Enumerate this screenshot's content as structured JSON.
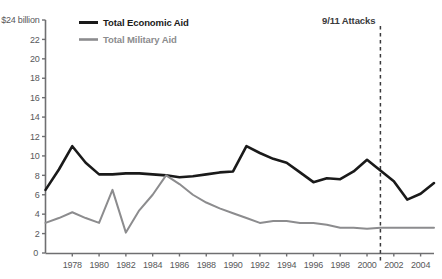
{
  "chart_data": {
    "type": "line",
    "title": "",
    "xlabel": "",
    "ylabel": "",
    "y_axis_top_label": "$24 billion",
    "xlim": [
      1976,
      2005
    ],
    "ylim": [
      0,
      24
    ],
    "grid": false,
    "legend_position": "top-left-inside",
    "y_ticks": [
      0,
      2,
      4,
      6,
      8,
      10,
      12,
      14,
      16,
      18,
      20,
      22,
      24
    ],
    "y_tick_labels": [
      "0",
      "2",
      "4",
      "6",
      "8",
      "10",
      "12",
      "14",
      "16",
      "18",
      "20",
      "22",
      "$24 billion"
    ],
    "x_ticks": [
      1978,
      1980,
      1982,
      1984,
      1986,
      1988,
      1990,
      1992,
      1994,
      1996,
      1998,
      2000,
      2002,
      2004
    ],
    "x_tick_labels": [
      "1978",
      "1980",
      "1982",
      "1984",
      "1986",
      "1988",
      "1990",
      "1992",
      "1994",
      "1996",
      "1998",
      "2000",
      "2002",
      "2004"
    ],
    "x_origin_label": "0",
    "x": [
      1976,
      1977,
      1978,
      1979,
      1980,
      1981,
      1982,
      1983,
      1984,
      1985,
      1986,
      1987,
      1988,
      1989,
      1990,
      1991,
      1992,
      1993,
      1994,
      1995,
      1996,
      1997,
      1998,
      1999,
      2000,
      2001,
      2002,
      2003,
      2004,
      2005
    ],
    "series": [
      {
        "name": "Total Economic Aid",
        "color": "#1a1a1a",
        "width": 2.6,
        "values": [
          6.5,
          8.6,
          11.0,
          9.3,
          8.1,
          8.1,
          8.2,
          8.2,
          8.1,
          8.0,
          7.8,
          7.9,
          8.1,
          8.3,
          8.4,
          11.0,
          10.3,
          9.7,
          9.3,
          8.3,
          7.3,
          7.7,
          7.6,
          8.4,
          9.6,
          8.5,
          7.4,
          5.5,
          6.1,
          7.2
        ]
      },
      {
        "name": "Total Military Aid",
        "color": "#8c8c8e",
        "width": 2.0,
        "values": [
          3.1,
          3.6,
          4.2,
          3.6,
          3.1,
          6.5,
          2.1,
          4.4,
          6.0,
          8.0,
          7.1,
          6.0,
          5.2,
          4.6,
          4.1,
          3.6,
          3.1,
          3.3,
          3.3,
          3.1,
          3.1,
          2.9,
          2.6,
          2.6,
          2.5,
          2.6,
          2.6,
          2.6,
          2.6,
          2.6
        ]
      }
    ],
    "annotations": [
      {
        "label": "9/11 Attacks",
        "x": 2001,
        "style": "dashed-vertical-line",
        "color": "#3a3a3c"
      }
    ]
  },
  "legend": {
    "items": [
      {
        "label": "Total Economic Aid",
        "color": "#1a1a1a"
      },
      {
        "label": "Total Military Aid",
        "color": "#8c8c8e"
      }
    ]
  }
}
